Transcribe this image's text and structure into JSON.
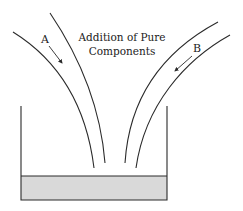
{
  "title": {
    "line1": "Addition of Pure",
    "line2": "Components"
  },
  "streams": [
    {
      "label": "A",
      "direction": "into-vessel"
    },
    {
      "label": "B",
      "direction": "into-vessel"
    }
  ],
  "colors": {
    "line": "#2a2a2a",
    "liquid": "#d9d9d9",
    "background": "#ffffff"
  }
}
